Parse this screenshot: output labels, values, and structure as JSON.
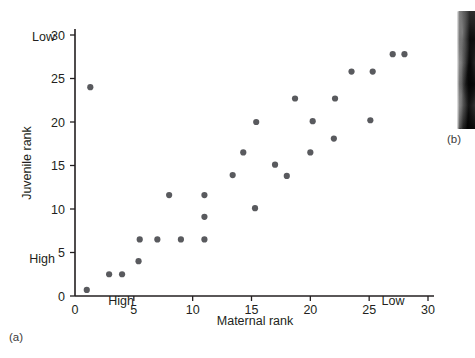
{
  "figure": {
    "panel_a_letter": "(a)",
    "panel_b_letter": "(b)"
  },
  "chart_data": {
    "type": "scatter",
    "title": "",
    "xlabel": "Maternal rank",
    "ylabel": "Juvenile rank",
    "xlim": [
      0,
      31
    ],
    "ylim": [
      0,
      31
    ],
    "xticks": [
      0,
      5,
      10,
      15,
      20,
      25,
      30
    ],
    "xtick_labels": [
      "0",
      "5",
      "10",
      "15",
      "20",
      "25",
      "30"
    ],
    "yticks": [
      0,
      5,
      10,
      15,
      20,
      25,
      30
    ],
    "ytick_labels": [
      "0",
      "5",
      "10",
      "15",
      "20",
      "25",
      "30"
    ],
    "grid": false,
    "legend": null,
    "axis_endpoint_labels": {
      "x_low_end": "High",
      "x_high_end": "Low",
      "y_low_end": "High",
      "y_high_end": "Low"
    },
    "marker": {
      "shape": "circle",
      "color": "#595a5e",
      "radius_px": 3.1
    },
    "points": [
      {
        "x": 1.0,
        "y": 0.7
      },
      {
        "x": 1.3,
        "y": 24.0
      },
      {
        "x": 2.9,
        "y": 2.5
      },
      {
        "x": 4.0,
        "y": 2.5
      },
      {
        "x": 5.4,
        "y": 4.0
      },
      {
        "x": 5.5,
        "y": 6.5
      },
      {
        "x": 7.0,
        "y": 6.5
      },
      {
        "x": 8.0,
        "y": 11.6
      },
      {
        "x": 9.0,
        "y": 6.5
      },
      {
        "x": 11.0,
        "y": 6.5
      },
      {
        "x": 11.0,
        "y": 9.1
      },
      {
        "x": 11.0,
        "y": 11.6
      },
      {
        "x": 13.4,
        "y": 13.9
      },
      {
        "x": 14.3,
        "y": 16.5
      },
      {
        "x": 15.3,
        "y": 10.1
      },
      {
        "x": 15.4,
        "y": 20.0
      },
      {
        "x": 17.0,
        "y": 15.1
      },
      {
        "x": 18.0,
        "y": 13.8
      },
      {
        "x": 18.7,
        "y": 22.7
      },
      {
        "x": 20.0,
        "y": 16.5
      },
      {
        "x": 20.2,
        "y": 20.1
      },
      {
        "x": 22.0,
        "y": 18.1
      },
      {
        "x": 22.1,
        "y": 22.7
      },
      {
        "x": 23.5,
        "y": 25.8
      },
      {
        "x": 25.1,
        "y": 20.2
      },
      {
        "x": 25.3,
        "y": 25.8
      },
      {
        "x": 27.0,
        "y": 27.8
      },
      {
        "x": 28.0,
        "y": 27.8
      }
    ]
  }
}
